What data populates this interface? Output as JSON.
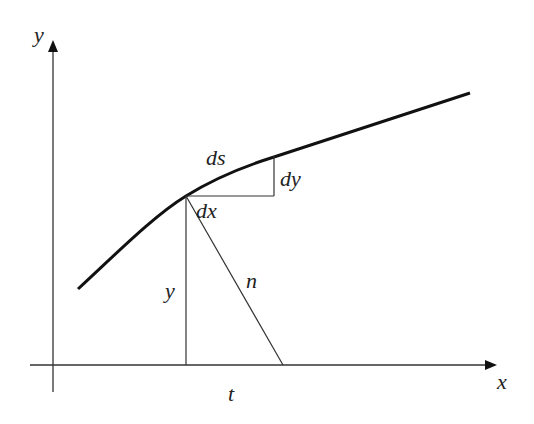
{
  "diagram": {
    "colors": {
      "stroke": "#222222",
      "curve": "#111111",
      "background": "#ffffff"
    },
    "axes": {
      "x_label": "x",
      "y_label": "y"
    },
    "labels": {
      "ds": "ds",
      "dy": "dy",
      "dx": "dx",
      "y": "y",
      "n": "n",
      "t": "t"
    },
    "curve_points": [
      [
        78,
        289
      ],
      [
        186,
        196
      ],
      [
        274,
        157
      ],
      [
        470,
        93
      ]
    ],
    "point": [
      186,
      196
    ],
    "normal_foot": [
      283,
      365
    ]
  }
}
